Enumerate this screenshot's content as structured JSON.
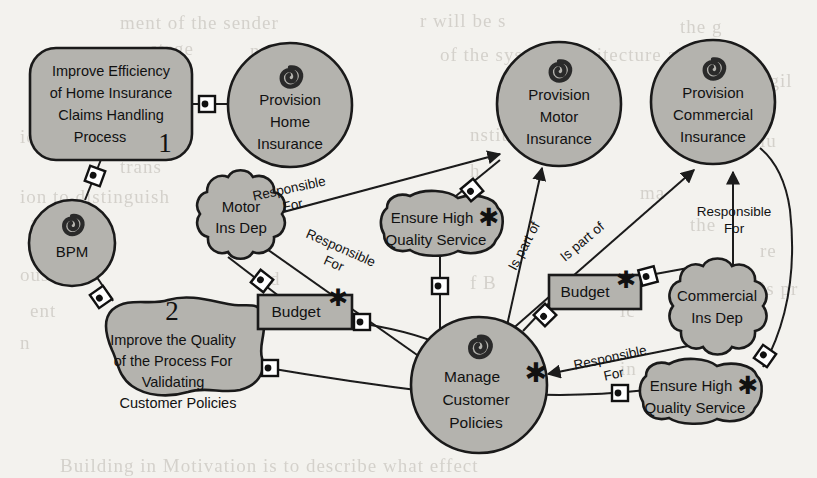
{
  "diagram": {
    "canvas": {
      "width": 817,
      "height": 478,
      "background": "#f3f2ee"
    },
    "palette": {
      "shape_fill": "#b4b3ae",
      "shape_stroke": "#1a1a1a",
      "edge_stroke": "#1a1a1a",
      "text": "#111111",
      "bleed_text": "#cfccc6"
    },
    "nodes": [
      {
        "id": "goal1",
        "type": "rounded-rectangle",
        "label_lines": [
          "Improve Efficiency",
          "of Home Insurance",
          "Claims Handling",
          "Process"
        ],
        "annotation": "1",
        "icon": null
      },
      {
        "id": "provHome",
        "type": "circle",
        "label_lines": [
          "Provision",
          "Home",
          "Insurance"
        ],
        "annotation": "",
        "icon": "knot-swirl-icon"
      },
      {
        "id": "provMotor",
        "type": "circle",
        "label_lines": [
          "Provision",
          "Motor",
          "Insurance"
        ],
        "annotation": "",
        "icon": "knot-swirl-icon"
      },
      {
        "id": "provComm",
        "type": "circle",
        "label_lines": [
          "Provision",
          "Commercial",
          "Insurance"
        ],
        "annotation": "",
        "icon": "knot-swirl-icon"
      },
      {
        "id": "bpm",
        "type": "circle",
        "label_lines": [
          "BPM"
        ],
        "annotation": "",
        "icon": "knot-swirl-icon"
      },
      {
        "id": "motorDep",
        "type": "cloud",
        "label_lines": [
          "Motor",
          "Ins Dep"
        ],
        "annotation": "",
        "icon": null
      },
      {
        "id": "ehqs1",
        "type": "rounded-blob",
        "label_lines": [
          "Ensure High",
          "Quality Service"
        ],
        "annotation": "",
        "icon": "asterisk-icon"
      },
      {
        "id": "goal2",
        "type": "wavy-blob",
        "label_lines": [
          "Improve the Quality",
          "of the Process For",
          "Validating",
          "Customer Policies"
        ],
        "annotation": "2",
        "icon": null
      },
      {
        "id": "budget1",
        "type": "rectangle",
        "label_lines": [
          "Budget"
        ],
        "annotation": "",
        "icon": "asterisk-icon"
      },
      {
        "id": "budget2",
        "type": "rectangle",
        "label_lines": [
          "Budget"
        ],
        "annotation": "",
        "icon": "asterisk-icon"
      },
      {
        "id": "manageCP",
        "type": "circle",
        "label_lines": [
          "Manage",
          "Customer",
          "Policies"
        ],
        "annotation": "",
        "icon": "knot-swirl-icon",
        "extra_icon": "asterisk-icon"
      },
      {
        "id": "commDep",
        "type": "cloud",
        "label_lines": [
          "Commercial",
          "Ins Dep"
        ],
        "annotation": "",
        "icon": null
      },
      {
        "id": "ehqs2",
        "type": "rounded-blob",
        "label_lines": [
          "Ensure High",
          "Quality Service"
        ],
        "annotation": "",
        "icon": "asterisk-icon"
      }
    ],
    "edge_labels": [
      {
        "id": "lbl-resp-1",
        "lines": [
          "Responsible",
          "For"
        ],
        "rotation": -12
      },
      {
        "id": "lbl-resp-2",
        "lines": [
          "Responsible",
          "For"
        ],
        "rotation": 24
      },
      {
        "id": "lbl-ispart-1",
        "lines": [
          "Is part of"
        ],
        "rotation": -62
      },
      {
        "id": "lbl-ispart-2",
        "lines": [
          "Is part of"
        ],
        "rotation": -40
      },
      {
        "id": "lbl-resp-3",
        "lines": [
          "Responsible",
          "For"
        ],
        "rotation": 0
      },
      {
        "id": "lbl-resp-4",
        "lines": [
          "Responsible",
          "For"
        ],
        "rotation": -12
      }
    ],
    "bleed_lines": [
      {
        "text": "ment of the sender",
        "x": 120,
        "y": 12
      },
      {
        "text": "r will be s",
        "x": 420,
        "y": 10
      },
      {
        "text": "stage",
        "x": 150,
        "y": 38
      },
      {
        "text": "n a  p  a  r",
        "x": 250,
        "y": 40
      },
      {
        "text": "of the system architecture and",
        "x": 440,
        "y": 44
      },
      {
        "text": "the g",
        "x": 680,
        "y": 16
      },
      {
        "text": "agil",
        "x": 760,
        "y": 70
      },
      {
        "text": "is a prescriptive",
        "x": 30,
        "y": 96
      },
      {
        "text": "also",
        "x": 690,
        "y": 100
      },
      {
        "text": "ions of a  pro",
        "x": 20,
        "y": 126
      },
      {
        "text": "nstitute the",
        "x": 470,
        "y": 124
      },
      {
        "text": "nclu",
        "x": 740,
        "y": 130
      },
      {
        "text": "trans",
        "x": 120,
        "y": 156
      },
      {
        "text": "h",
        "x": 470,
        "y": 160
      },
      {
        "text": "ion to distinguish",
        "x": 20,
        "y": 186
      },
      {
        "text": "ma",
        "x": 640,
        "y": 182
      },
      {
        "text": "a prim",
        "x": 30,
        "y": 212
      },
      {
        "text": "the",
        "x": 690,
        "y": 214
      },
      {
        "text": "d",
        "x": 440,
        "y": 238
      },
      {
        "text": "re",
        "x": 760,
        "y": 240
      },
      {
        "text": "ous",
        "x": 20,
        "y": 264
      },
      {
        "text": "and",
        "x": 250,
        "y": 268
      },
      {
        "text": "f B",
        "x": 470,
        "y": 272
      },
      {
        "text": "is pr",
        "x": 760,
        "y": 278
      },
      {
        "text": "ent",
        "x": 30,
        "y": 300
      },
      {
        "text": "ic",
        "x": 620,
        "y": 300
      },
      {
        "text": "n",
        "x": 470,
        "y": 326
      },
      {
        "text": "n",
        "x": 20,
        "y": 332
      },
      {
        "text": "s a n",
        "x": 690,
        "y": 330
      },
      {
        "text": "in",
        "x": 620,
        "y": 358
      },
      {
        "text": "Building in Motivation is to describe what effect",
        "x": 60,
        "y": 455
      }
    ]
  }
}
